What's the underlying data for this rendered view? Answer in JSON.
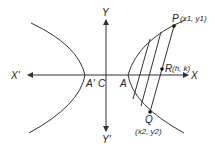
{
  "diagram": {
    "type": "hyperbola-chord-midpoint",
    "labels": {
      "x_pos": "X",
      "x_neg": "X'",
      "y_pos": "Y",
      "y_neg": "Y'",
      "center": "C",
      "vertex_right": "A",
      "vertex_left": "A'",
      "point_p": "P",
      "point_p_coords": "(x1, y1)",
      "point_q": "Q",
      "point_q_coords": "(x2, y2)",
      "point_r": "R",
      "point_r_coords": "(h, k)"
    },
    "colors": {
      "line": "#333333",
      "text": "#222222",
      "background": "#ffffff"
    }
  }
}
